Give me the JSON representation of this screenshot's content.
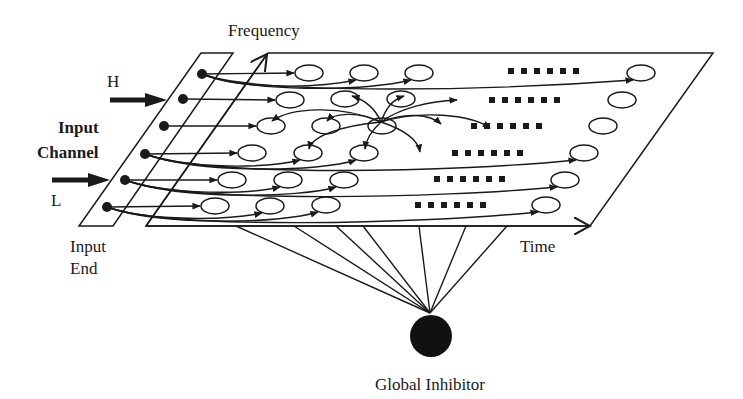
{
  "labels": {
    "frequency": "Frequency",
    "time": "Time",
    "high": "H",
    "low": "L",
    "input_channel_line1": "Input",
    "input_channel_line2": "Channel",
    "input_end_line1": "Input",
    "input_end_line2": "End",
    "global_inhibitor": "Global Inhibitor"
  },
  "colors": {
    "stroke": "#1a1a1a",
    "background": "#ffffff"
  },
  "diagram": {
    "rows": 6,
    "oscillators_per_row_visible": 4,
    "ellipsis": "......",
    "nodes": [
      "input nodes (6)",
      "oscillators (24)",
      "global inhibitor (1)"
    ],
    "axes": [
      "Frequency",
      "Time"
    ]
  }
}
